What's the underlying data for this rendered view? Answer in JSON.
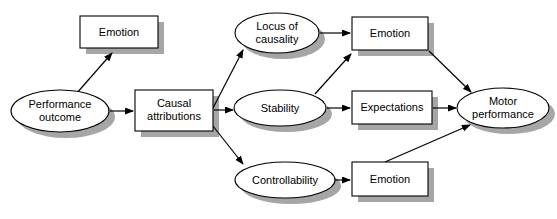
{
  "diagram": {
    "background_color": "#ffffff",
    "stroke_color": "#000000",
    "shadow_color": "#a6a6a6",
    "fill_color": "#ffffff",
    "nodes": [
      {
        "id": "performance-outcome",
        "label_line1": "Performance",
        "label_line2": "outcome",
        "shape": "ellipse",
        "cx": 60,
        "cy": 111,
        "rx": 49,
        "ry": 21
      },
      {
        "id": "emotion-top-left",
        "label_line1": "Emotion",
        "label_line2": "",
        "shape": "rect",
        "x": 80,
        "y": 16,
        "w": 78,
        "h": 32
      },
      {
        "id": "causal-attributions",
        "label_line1": "Causal",
        "label_line2": "attributions",
        "shape": "rect",
        "x": 135,
        "y": 90,
        "w": 78,
        "h": 41
      },
      {
        "id": "locus-of-causality",
        "label_line1": "Locus of",
        "label_line2": "causality",
        "shape": "ellipse",
        "cx": 277,
        "cy": 33,
        "rx": 42,
        "ry": 20
      },
      {
        "id": "stability",
        "label_line1": "Stability",
        "label_line2": "",
        "shape": "ellipse",
        "cx": 280,
        "cy": 108,
        "rx": 46,
        "ry": 18
      },
      {
        "id": "controllability",
        "label_line1": "Controllability",
        "label_line2": "",
        "shape": "ellipse",
        "cx": 285,
        "cy": 180,
        "rx": 50,
        "ry": 18
      },
      {
        "id": "emotion-top-right",
        "label_line1": "Emotion",
        "label_line2": "",
        "shape": "rect",
        "x": 352,
        "y": 17,
        "w": 76,
        "h": 33
      },
      {
        "id": "expectations",
        "label_line1": "Expectations",
        "label_line2": "",
        "shape": "rect",
        "x": 352,
        "y": 91,
        "w": 80,
        "h": 33
      },
      {
        "id": "emotion-bottom-right",
        "label_line1": "Emotion",
        "label_line2": "",
        "shape": "rect",
        "x": 352,
        "y": 162,
        "w": 76,
        "h": 34
      },
      {
        "id": "motor-performance",
        "label_line1": "Motor",
        "label_line2": "performance",
        "shape": "ellipse",
        "cx": 503,
        "cy": 108,
        "rx": 46,
        "ry": 20
      }
    ],
    "edges": [
      {
        "id": "edge-performance-to-emotion-top",
        "from": "performance-outcome",
        "to": "emotion-top-left",
        "x1": 76,
        "y1": 94,
        "x2": 112,
        "y2": 53
      },
      {
        "id": "edge-performance-to-causal",
        "from": "performance-outcome",
        "to": "causal-attributions",
        "x1": 110,
        "y1": 111,
        "x2": 133,
        "y2": 111
      },
      {
        "id": "edge-causal-to-locus",
        "from": "causal-attributions",
        "to": "locus-of-causality",
        "x1": 213,
        "y1": 108,
        "x2": 243,
        "y2": 50
      },
      {
        "id": "edge-causal-to-stability",
        "from": "causal-attributions",
        "to": "stability",
        "x1": 214,
        "y1": 110,
        "x2": 233,
        "y2": 110
      },
      {
        "id": "edge-causal-to-controllability",
        "from": "causal-attributions",
        "to": "controllability",
        "x1": 213,
        "y1": 126,
        "x2": 243,
        "y2": 164
      },
      {
        "id": "edge-locus-to-emotion-top-right",
        "from": "locus-of-causality",
        "to": "emotion-top-right",
        "x1": 320,
        "y1": 33,
        "x2": 350,
        "y2": 33
      },
      {
        "id": "edge-stability-to-emotion-top-right",
        "from": "stability",
        "to": "emotion-top-right",
        "x1": 315,
        "y1": 94,
        "x2": 351,
        "y2": 54
      },
      {
        "id": "edge-stability-to-expectations",
        "from": "stability",
        "to": "expectations",
        "x1": 327,
        "y1": 108,
        "x2": 350,
        "y2": 108
      },
      {
        "id": "edge-controllability-to-emotion-bottom",
        "from": "controllability",
        "to": "emotion-bottom-right",
        "x1": 335,
        "y1": 180,
        "x2": 350,
        "y2": 180
      },
      {
        "id": "edge-emotion-top-right-to-motor",
        "from": "emotion-top-right",
        "to": "motor-performance",
        "x1": 429,
        "y1": 51,
        "x2": 471,
        "y2": 92
      },
      {
        "id": "edge-expectations-to-motor",
        "from": "expectations",
        "to": "motor-performance",
        "x1": 433,
        "y1": 108,
        "x2": 456,
        "y2": 108
      },
      {
        "id": "edge-emotion-bottom-to-motor",
        "from": "emotion-bottom-right",
        "to": "motor-performance",
        "x1": 385,
        "y1": 162,
        "x2": 470,
        "y2": 125
      }
    ]
  }
}
